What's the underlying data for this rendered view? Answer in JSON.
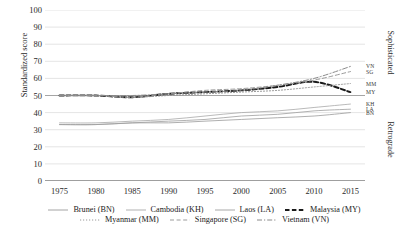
{
  "chart_data": {
    "type": "line",
    "title": "",
    "xlabel": "",
    "ylabel": "Standardized score",
    "xlim": [
      1973,
      2017
    ],
    "ylim": [
      0,
      100
    ],
    "grid": true,
    "legend_position": "bottom",
    "x_ticks": [
      "1975",
      "1980",
      "1985",
      "1990",
      "1995",
      "2000",
      "2005",
      "2010",
      "2015"
    ],
    "y_ticks": [
      "0",
      "10",
      "20",
      "30",
      "40",
      "50",
      "60",
      "70",
      "80",
      "90",
      "100"
    ],
    "right_axis_bands": [
      {
        "label": "Sophisticated",
        "range": [
          50,
          100
        ]
      },
      {
        "label": "Retrograde",
        "range": [
          0,
          50
        ]
      }
    ],
    "x": [
      1975,
      1980,
      1985,
      1990,
      1995,
      2000,
      2005,
      2010,
      2015
    ],
    "series": [
      {
        "name": "Brunei (BN)",
        "code": "BN",
        "style": "solid",
        "width": 0.8,
        "color": "#9a9a9a",
        "end_label_value": 40,
        "values": [
          33,
          33,
          34,
          34,
          35,
          36,
          37,
          38,
          40
        ]
      },
      {
        "name": "Cambodia (KH)",
        "code": "KH",
        "style": "solid",
        "width": 0.8,
        "color": "#a8a8a8",
        "end_label_value": 45,
        "values": [
          34,
          34,
          35,
          36,
          38,
          40,
          41,
          43,
          45
        ]
      },
      {
        "name": "Laos (LA)",
        "code": "LA",
        "style": "solid",
        "width": 0.8,
        "color": "#9e9e9e",
        "end_label_value": 42,
        "values": [
          33,
          33,
          34,
          35,
          36,
          38,
          39,
          41,
          42
        ]
      },
      {
        "name": "Malaysia (MY)",
        "code": "MY",
        "style": "dashed-bold",
        "width": 1.9,
        "color": "#1a1a1a",
        "end_label_value": 52,
        "values": [
          50,
          50,
          49,
          51,
          52,
          53,
          55,
          58,
          52
        ]
      },
      {
        "name": "Myanmar (MM)",
        "code": "MM",
        "style": "dotted",
        "width": 0.9,
        "color": "#8f8f8f",
        "end_label_value": 57,
        "values": [
          50,
          50,
          49,
          50,
          51,
          52,
          53,
          55,
          57
        ]
      },
      {
        "name": "Singapore (SG)",
        "code": "SG",
        "style": "dashed",
        "width": 1.0,
        "color": "#9b9b9b",
        "end_label_value": 64,
        "values": [
          50,
          50,
          49,
          51,
          53,
          54,
          56,
          59,
          64
        ]
      },
      {
        "name": "Vietnam (VN)",
        "code": "VN",
        "style": "dash-dot",
        "width": 1.0,
        "color": "#8a8a8a",
        "end_label_value": 67,
        "values": [
          50,
          50,
          50,
          51,
          52,
          53,
          56,
          60,
          67
        ]
      }
    ]
  },
  "legend": {
    "row1": [
      "Brunei (BN)",
      "Cambodia (KH)",
      "Laos (LA)",
      "Malaysia (MY)"
    ],
    "row2": [
      "Myanmar (MM)",
      "Singapore (SG)",
      "Vietnam (VN)"
    ]
  }
}
